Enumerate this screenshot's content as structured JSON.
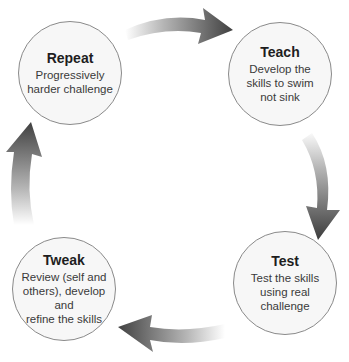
{
  "diagram": {
    "type": "cycle",
    "nodes": [
      {
        "id": "repeat",
        "title": "Repeat",
        "desc_lines": [
          "Progressively",
          "harder challenge"
        ]
      },
      {
        "id": "teach",
        "title": "Teach",
        "desc_lines": [
          "Develop the",
          "skills to swim",
          "not sink"
        ]
      },
      {
        "id": "test",
        "title": "Test",
        "desc_lines": [
          "Test the skills",
          "using real",
          "challenge"
        ]
      },
      {
        "id": "tweak",
        "title": "Tweak",
        "desc_lines": [
          "Review (self and",
          "others), develop and",
          "refine the skills"
        ]
      }
    ],
    "edges": [
      {
        "from": "repeat",
        "to": "teach"
      },
      {
        "from": "teach",
        "to": "test"
      },
      {
        "from": "test",
        "to": "tweak"
      },
      {
        "from": "tweak",
        "to": "repeat"
      }
    ],
    "colors": {
      "arrow_dark": "#3c3c3c",
      "arrow_light": "#ffffff",
      "circle_border": "#8a8a8a",
      "circle_fill": "#f7f7f7"
    }
  }
}
